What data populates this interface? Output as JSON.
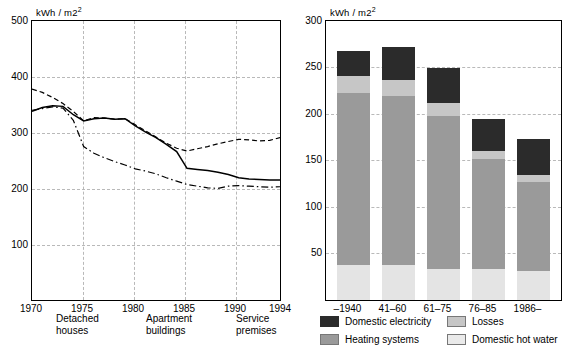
{
  "caption": "Figure 2. Specific energy consumption of ... and ...",
  "left_chart": {
    "unit_label": "kWh / m2",
    "y_ticks": [
      "500",
      "400",
      "300",
      "200",
      "100"
    ],
    "x_ticks": [
      "1970",
      "1975",
      "1980",
      "1985",
      "1990",
      "1994"
    ],
    "legend": [
      {
        "key": "detached",
        "style": "dash-dot",
        "line1": "Detached",
        "line2": "houses"
      },
      {
        "key": "apartment",
        "style": "solid",
        "line1": "Apartment",
        "line2": "buildings"
      },
      {
        "key": "service",
        "style": "dashed",
        "line1": "Service",
        "line2": "premises"
      }
    ]
  },
  "right_chart": {
    "unit_label": "kWh / m2",
    "y_ticks": [
      "300",
      "250",
      "200",
      "150",
      "100",
      "50"
    ],
    "x_ticks": [
      "–1940",
      "41–60",
      "61–75",
      "76–85",
      "1986–"
    ],
    "legend": [
      {
        "key": "domestic-electricity",
        "label": "Domestic electricity",
        "swatch": "sw-elec"
      },
      {
        "key": "losses",
        "label": "Losses",
        "swatch": "sw-loss"
      },
      {
        "key": "heating-systems",
        "label": "Heating systems",
        "swatch": "sw-heat"
      },
      {
        "key": "domestic-hot-water",
        "label": "Domestic hot water",
        "swatch": "sw-hw"
      }
    ]
  },
  "chart_data": [
    {
      "type": "line",
      "title": "",
      "xlabel": "",
      "ylabel": "kWh / m2",
      "xlim": [
        1970,
        1994
      ],
      "ylim": [
        0,
        500
      ],
      "yticks": [
        100,
        200,
        300,
        400,
        500
      ],
      "xticks": [
        1970,
        1975,
        1980,
        1985,
        1990,
        1994
      ],
      "grid": true,
      "legend_position": "below",
      "x": [
        1970,
        1971,
        1972,
        1973,
        1974,
        1975,
        1976,
        1977,
        1978,
        1979,
        1980,
        1981,
        1982,
        1983,
        1984,
        1985,
        1986,
        1987,
        1988,
        1989,
        1990,
        1991,
        1992,
        1993,
        1994
      ],
      "series": [
        {
          "name": "Detached houses",
          "style": "dash-dot",
          "values": [
            340,
            343,
            346,
            344,
            322,
            275,
            263,
            255,
            248,
            242,
            235,
            231,
            226,
            219,
            213,
            207,
            204,
            201,
            200,
            204,
            205,
            204,
            203,
            202,
            203
          ]
        },
        {
          "name": "Apartment buildings",
          "style": "solid",
          "values": [
            338,
            345,
            348,
            347,
            332,
            321,
            325,
            326,
            324,
            325,
            312,
            301,
            291,
            279,
            266,
            236,
            234,
            232,
            229,
            225,
            219,
            217,
            216,
            215,
            215
          ]
        },
        {
          "name": "Service premises",
          "style": "dashed",
          "values": [
            378,
            372,
            363,
            352,
            338,
            321,
            327,
            326,
            324,
            325,
            314,
            303,
            292,
            281,
            272,
            267,
            271,
            275,
            280,
            284,
            288,
            287,
            285,
            286,
            291
          ]
        }
      ]
    },
    {
      "type": "bar",
      "subtype": "stacked",
      "title": "",
      "xlabel": "",
      "ylabel": "kWh / m2",
      "ylim": [
        0,
        300
      ],
      "yticks": [
        50,
        100,
        150,
        200,
        250,
        300
      ],
      "grid": true,
      "legend_position": "below",
      "categories": [
        "–1940",
        "41–60",
        "61–75",
        "76–85",
        "1986–"
      ],
      "series": [
        {
          "name": "Domestic hot water",
          "values": [
            38,
            38,
            33,
            33,
            31
          ]
        },
        {
          "name": "Heating systems",
          "values": [
            185,
            181,
            165,
            119,
            96
          ]
        },
        {
          "name": "Losses",
          "values": [
            18,
            18,
            14,
            8,
            7
          ]
        },
        {
          "name": "Domestic electricity",
          "values": [
            27,
            35,
            38,
            35,
            39
          ]
        }
      ],
      "totals": [
        268,
        272,
        250,
        195,
        173
      ]
    }
  ]
}
